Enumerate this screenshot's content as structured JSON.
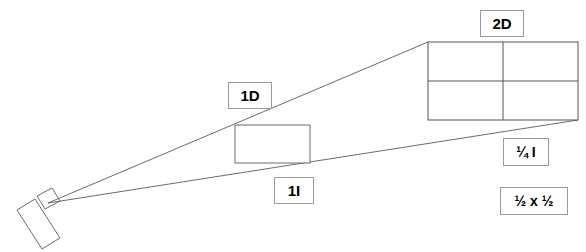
{
  "diagram": {
    "background_color": "#ffffff",
    "stroke_color": "#6b6b6b",
    "label_border_color": "#9a9a9a",
    "text_color": "#000000",
    "camera": {
      "name": "camera",
      "body_points": "17,210 35,199 60,238 42,249",
      "lens_points": "37,196 52,188 60,201 45,209",
      "apex_x": 48,
      "apex_y": 203
    },
    "rays": [
      {
        "name": "upper-projection-ray",
        "x1": 48,
        "y1": 203,
        "x2": 428,
        "y2": 42
      },
      {
        "name": "lower-projection-ray",
        "x1": 48,
        "y1": 203,
        "x2": 578,
        "y2": 120
      }
    ],
    "near_plane": {
      "name": "1d-rectangle",
      "x": 235,
      "y": 125,
      "width": 75,
      "height": 38
    },
    "far_plane": {
      "name": "2d-grid",
      "x": 428,
      "y": 42,
      "width": 150,
      "height": 78,
      "columns": 2,
      "rows": 2,
      "mid_x": 503,
      "mid_y": 81
    },
    "labels": [
      {
        "id": "label-2d",
        "name": "label-2d",
        "text": "2D"
      },
      {
        "id": "label-1d",
        "name": "label-1d",
        "text": "1D"
      },
      {
        "id": "label-1i",
        "name": "label-1i",
        "text": "1I"
      },
      {
        "id": "label-quarter-i",
        "name": "label-quarter-intensity",
        "text": "¼ I"
      },
      {
        "id": "label-half-x-half",
        "name": "label-half-by-half",
        "text": "½ x ½"
      }
    ],
    "label_2d": "2D",
    "label_1d": "1D",
    "label_1i": "1I",
    "label_quarter_i": "¼ I",
    "label_half_x_half": "½ x ½"
  }
}
